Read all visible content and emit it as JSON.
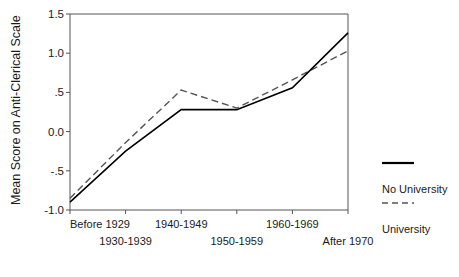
{
  "chart_data": {
    "type": "line",
    "title": "",
    "xlabel": "",
    "ylabel": "Mean Score on Anti-Clerical Scale",
    "categories": [
      "Before 1929",
      "1930-1939",
      "1940-1949",
      "1950-1959",
      "1960-1969",
      "After 1970"
    ],
    "ylim": [
      -1.0,
      1.5
    ],
    "yticks": [
      1.5,
      1.0,
      0.5,
      0.0,
      -0.5,
      -1.0
    ],
    "ytick_labels": [
      "1.5",
      "1.0",
      ".5",
      "0.0",
      "-.5",
      "-1.0"
    ],
    "grid": false,
    "legend_position": "right",
    "series": [
      {
        "name": "No University",
        "style": "solid",
        "color": "#000000",
        "values": [
          -0.9,
          -0.25,
          0.28,
          0.28,
          0.56,
          1.26
        ]
      },
      {
        "name": "University",
        "style": "dashed",
        "color": "#555555",
        "values": [
          -0.85,
          -0.14,
          0.53,
          0.3,
          0.66,
          1.03
        ]
      }
    ]
  },
  "axis": {
    "y_title": "Mean Score on Anti-Clerical Scale",
    "ticks": [
      {
        "label": "1.5",
        "value": 1.5
      },
      {
        "label": "1.0",
        "value": 1.0
      },
      {
        "label": ".5",
        "value": 0.5
      },
      {
        "label": "0.0",
        "value": 0.0
      },
      {
        "label": "-.5",
        "value": -0.5
      },
      {
        "label": "-1.0",
        "value": -1.0
      }
    ],
    "categories": [
      {
        "label": "Before 1929",
        "row": 0
      },
      {
        "label": "1930-1939",
        "row": 1
      },
      {
        "label": "1940-1949",
        "row": 0
      },
      {
        "label": "1950-1959",
        "row": 1
      },
      {
        "label": "1960-1969",
        "row": 0
      },
      {
        "label": "After 1970",
        "row": 1
      }
    ]
  },
  "legend": {
    "entries": [
      {
        "label": "No University",
        "style": "solid"
      },
      {
        "label": "University",
        "style": "dashed"
      }
    ]
  }
}
